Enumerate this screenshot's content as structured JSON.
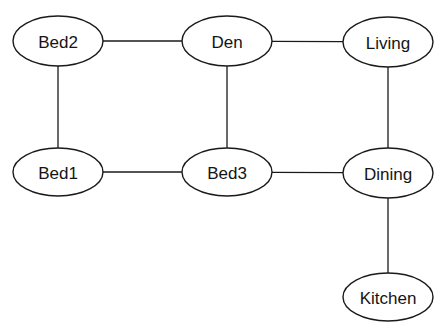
{
  "diagram": {
    "type": "undirected-graph",
    "nodes": [
      {
        "id": "bed2",
        "label": "Bed2",
        "cx": 58,
        "cy": 41,
        "rx": 45,
        "ry": 25
      },
      {
        "id": "den",
        "label": "Den",
        "cx": 227,
        "cy": 41,
        "rx": 45,
        "ry": 25
      },
      {
        "id": "living",
        "label": "Living",
        "cx": 388,
        "cy": 42,
        "rx": 45,
        "ry": 25
      },
      {
        "id": "bed1",
        "label": "Bed1",
        "cx": 58,
        "cy": 172,
        "rx": 45,
        "ry": 24
      },
      {
        "id": "bed3",
        "label": "Bed3",
        "cx": 227,
        "cy": 172,
        "rx": 45,
        "ry": 24
      },
      {
        "id": "dining",
        "label": "Dining",
        "cx": 388,
        "cy": 173,
        "rx": 45,
        "ry": 25
      },
      {
        "id": "kitchen",
        "label": "Kitchen",
        "cx": 388,
        "cy": 297,
        "rx": 45,
        "ry": 24
      }
    ],
    "edges": [
      {
        "from": "bed2",
        "to": "den"
      },
      {
        "from": "den",
        "to": "living"
      },
      {
        "from": "bed2",
        "to": "bed1"
      },
      {
        "from": "den",
        "to": "bed3"
      },
      {
        "from": "living",
        "to": "dining"
      },
      {
        "from": "bed1",
        "to": "bed3"
      },
      {
        "from": "bed3",
        "to": "dining"
      },
      {
        "from": "dining",
        "to": "kitchen"
      }
    ]
  }
}
